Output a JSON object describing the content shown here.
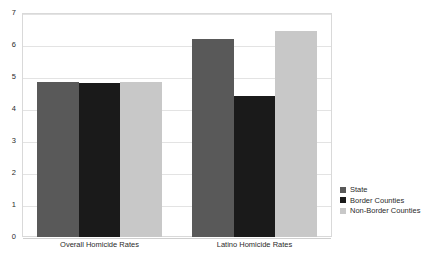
{
  "chart_data": {
    "type": "bar",
    "title": "",
    "subtitle": "",
    "xlabel": "",
    "ylabel": "",
    "categories": [
      "Overall Homicide Rates",
      "Latino Homicide Rates"
    ],
    "series": [
      {
        "name": "State",
        "color": "#595959",
        "values": [
          4.85,
          6.2
        ]
      },
      {
        "name": "Border Counties",
        "color": "#1a1a1a",
        "values": [
          4.8,
          4.4
        ]
      },
      {
        "name": "Non-Border Counties",
        "color": "#c8c8c8",
        "values": [
          4.85,
          6.45
        ]
      }
    ],
    "ylim": [
      0,
      7
    ],
    "yticks": [
      0,
      1,
      2,
      3,
      4,
      5,
      6,
      7
    ],
    "ytick_labels": [
      "0",
      "1",
      "2",
      "3",
      "4",
      "5",
      "6",
      "7"
    ],
    "grid": true,
    "grid_axis": "y",
    "legend_position": "right",
    "legend_entries": [
      "State",
      "Border Counties",
      "Non-Border Counties"
    ],
    "annotations": []
  },
  "colors": {
    "background": "#ffffff",
    "gridline": "#e3e3e3",
    "frame": "#d9d9d9",
    "text": "#2b2b2b"
  }
}
